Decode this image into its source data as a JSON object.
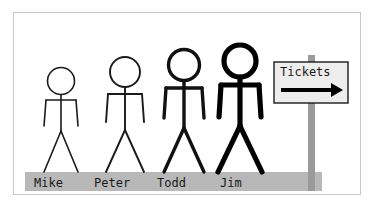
{
  "illustration": {
    "title": "Stick figures queued at a Tickets sign",
    "background_color": "#ffffff",
    "frame_border_color": "#c9c9c9",
    "ground": {
      "name": "ground-strip",
      "color": "#b8b8b8",
      "x": 25,
      "y": 172,
      "width": 297,
      "height": 19
    },
    "figures": [
      {
        "name": "Mike",
        "label": "Mike",
        "stroke_color": "#1a1a1a",
        "stroke_width": 1.6,
        "head_cx": 61,
        "head_cy": 81,
        "head_r": 13.5,
        "neck_y": 95,
        "hip_y": 131,
        "arm_y": 100,
        "arm_span": 15,
        "arm_drop": 26,
        "foot_y": 172,
        "foot_span": 17,
        "label_x": 34,
        "label_y": 177
      },
      {
        "name": "Peter",
        "label": "Peter",
        "stroke_color": "#1a1a1a",
        "stroke_width": 1.9,
        "head_cx": 125,
        "head_cy": 72,
        "head_r": 15,
        "neck_y": 88,
        "hip_y": 130,
        "arm_y": 94,
        "arm_span": 17,
        "arm_drop": 28,
        "foot_y": 172,
        "foot_span": 19,
        "label_x": 94,
        "label_y": 177
      },
      {
        "name": "Todd",
        "label": "Todd",
        "stroke_color": "#111111",
        "stroke_width": 3.4,
        "head_cx": 184,
        "head_cy": 65,
        "head_r": 15.5,
        "neck_y": 81,
        "hip_y": 128,
        "arm_y": 88,
        "arm_span": 18,
        "arm_drop": 30,
        "foot_y": 172,
        "foot_span": 20,
        "label_x": 157,
        "label_y": 177
      },
      {
        "name": "Jim",
        "label": "Jim",
        "stroke_color": "#000000",
        "stroke_width": 5.2,
        "head_cx": 240,
        "head_cy": 61,
        "head_r": 16,
        "neck_y": 77,
        "hip_y": 126,
        "arm_y": 85,
        "arm_span": 19,
        "arm_drop": 32,
        "foot_y": 172,
        "foot_span": 22,
        "label_x": 220,
        "label_y": 177
      }
    ],
    "sign": {
      "name": "tickets-sign",
      "text": "Tickets",
      "arrow_direction": "right",
      "board_fill": "#ededed",
      "board_border": "#1a1a1a",
      "board_x": 274,
      "board_y": 62,
      "board_width": 74,
      "board_height": 41,
      "post_color": "#9a9a9a",
      "post_x": 308,
      "post_top": 55,
      "post_bottom": 191,
      "post_width": 7,
      "arrow_color": "#000000",
      "arrow_y": 90,
      "arrow_x1": 281,
      "arrow_x2": 337
    }
  }
}
